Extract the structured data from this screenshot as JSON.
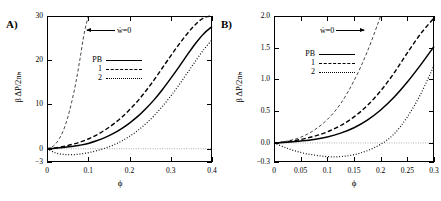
{
  "figure": {
    "panels": [
      {
        "id": "A",
        "label": "A)",
        "ylabel": "β ΔP/2nₕ",
        "xlabel": "ϕ",
        "yticks": [
          "30",
          "20",
          "10",
          "0",
          "-3"
        ],
        "ytick_values": [
          30,
          20,
          10,
          0,
          -3
        ],
        "xticks": [
          "0",
          "0.1",
          "0.2",
          "0.3",
          "0.4"
        ],
        "xtick_values": [
          0,
          0.1,
          0.2,
          0.3,
          0.4
        ],
        "xlim": [
          0,
          0.4
        ],
        "ylim": [
          -3,
          30
        ],
        "annotation": "ẇ=0",
        "annotation_direction": "left",
        "legend": [
          {
            "key": "PB",
            "style": "solid"
          },
          {
            "key": "1",
            "style": "dash"
          },
          {
            "key": "2",
            "style": "dot"
          }
        ]
      },
      {
        "id": "B",
        "label": "B)",
        "ylabel": "β ΔP/2nₕ",
        "xlabel": "ϕ",
        "yticks": [
          "2.0",
          "1.5",
          "1.0",
          "0.5",
          "0.0",
          "-0.3"
        ],
        "ytick_values": [
          2.0,
          1.5,
          1.0,
          0.5,
          0.0,
          -0.3
        ],
        "xticks": [
          "0",
          "0.05",
          "0.1",
          "0.15",
          "0.2",
          "0.25",
          "0.3"
        ],
        "xtick_values": [
          0,
          0.05,
          0.1,
          0.15,
          0.2,
          0.25,
          0.3
        ],
        "xlim": [
          0,
          0.3
        ],
        "ylim": [
          -0.3,
          2.0
        ],
        "annotation": "ẇ=0",
        "annotation_direction": "right",
        "legend": [
          {
            "key": "PB",
            "style": "solid"
          },
          {
            "key": "1",
            "style": "dash"
          },
          {
            "key": "2",
            "style": "dot"
          }
        ]
      }
    ]
  },
  "chart_data": [
    {
      "type": "line",
      "title": "A)",
      "xlabel": "ϕ",
      "ylabel": "β ΔP/2nₕ",
      "xlim": [
        0,
        0.4
      ],
      "ylim": [
        -3,
        30
      ],
      "grid": false,
      "legend_position": "upper-left-inside",
      "annotations": [
        {
          "text": "ẇ=0",
          "points_to": "steep-dashed-curve",
          "direction": "left"
        }
      ],
      "series": [
        {
          "name": "PB",
          "style": "solid",
          "x": [
            0,
            0.02,
            0.04,
            0.06,
            0.08,
            0.1,
            0.12,
            0.14,
            0.16,
            0.18,
            0.2,
            0.22,
            0.24,
            0.26,
            0.28,
            0.3,
            0.32,
            0.34,
            0.36,
            0.38,
            0.4
          ],
          "y": [
            0,
            0.1,
            0.25,
            0.5,
            0.8,
            1.2,
            1.8,
            2.5,
            3.4,
            4.5,
            5.8,
            7.3,
            9.1,
            11.1,
            13.4,
            15.9,
            18.5,
            21.2,
            23.8,
            26.0,
            27.6
          ]
        },
        {
          "name": "1",
          "style": "dash",
          "x": [
            0,
            0.02,
            0.04,
            0.06,
            0.08,
            0.1,
            0.12,
            0.14,
            0.16,
            0.18,
            0.2,
            0.22,
            0.24,
            0.26,
            0.28,
            0.3,
            0.32,
            0.34,
            0.36,
            0.38,
            0.4
          ],
          "y": [
            0,
            0.2,
            0.5,
            0.95,
            1.5,
            2.2,
            3.1,
            4.2,
            5.5,
            7.0,
            8.8,
            10.8,
            13.1,
            15.6,
            18.3,
            21.0,
            23.6,
            26.0,
            28.1,
            29.6,
            30.0
          ]
        },
        {
          "name": "2",
          "style": "dot",
          "x": [
            0,
            0.02,
            0.04,
            0.06,
            0.08,
            0.1,
            0.12,
            0.14,
            0.16,
            0.18,
            0.2,
            0.22,
            0.24,
            0.26,
            0.28,
            0.3,
            0.32,
            0.34,
            0.36,
            0.38,
            0.4
          ],
          "y": [
            0,
            -0.9,
            -1.3,
            -1.35,
            -1.2,
            -0.9,
            -0.45,
            0.1,
            0.8,
            1.7,
            2.8,
            4.1,
            5.7,
            7.5,
            9.6,
            11.9,
            14.4,
            17.1,
            19.8,
            22.4,
            24.6
          ]
        },
        {
          "name": "psi-dot-zero",
          "style": "dash-thin",
          "x": [
            0,
            0.01,
            0.02,
            0.03,
            0.04,
            0.05,
            0.06,
            0.07,
            0.08,
            0.09,
            0.1
          ],
          "y": [
            0,
            0.3,
            1.0,
            2.3,
            4.2,
            7.0,
            10.6,
            15.0,
            20.3,
            26.0,
            30.0
          ]
        }
      ]
    },
    {
      "type": "line",
      "title": "B)",
      "xlabel": "ϕ",
      "ylabel": "β ΔP/2nₕ",
      "xlim": [
        0,
        0.3
      ],
      "ylim": [
        -0.3,
        2.0
      ],
      "grid": false,
      "legend_position": "upper-left-inside",
      "annotations": [
        {
          "text": "ẇ=0",
          "points_to": "steep-dashed-curve",
          "direction": "right"
        }
      ],
      "series": [
        {
          "name": "PB",
          "style": "solid",
          "x": [
            0,
            0.025,
            0.05,
            0.075,
            0.1,
            0.125,
            0.15,
            0.175,
            0.2,
            0.225,
            0.25,
            0.275,
            0.3
          ],
          "y": [
            0,
            0.01,
            0.03,
            0.055,
            0.095,
            0.155,
            0.24,
            0.36,
            0.52,
            0.72,
            0.96,
            1.23,
            1.52
          ]
        },
        {
          "name": "1",
          "style": "dash",
          "x": [
            0,
            0.025,
            0.05,
            0.075,
            0.1,
            0.125,
            0.15,
            0.175,
            0.2,
            0.225,
            0.25,
            0.275,
            0.3
          ],
          "y": [
            0,
            0.02,
            0.055,
            0.105,
            0.175,
            0.275,
            0.41,
            0.59,
            0.82,
            1.1,
            1.42,
            1.72,
            1.97
          ]
        },
        {
          "name": "2",
          "style": "dot",
          "x": [
            0,
            0.025,
            0.05,
            0.075,
            0.1,
            0.125,
            0.15,
            0.175,
            0.2,
            0.225,
            0.25,
            0.275,
            0.3
          ],
          "y": [
            0,
            -0.085,
            -0.15,
            -0.19,
            -0.215,
            -0.215,
            -0.185,
            -0.12,
            -0.02,
            0.14,
            0.41,
            0.77,
            1.22
          ]
        },
        {
          "name": "psi-dot-zero",
          "style": "dash-thin",
          "x": [
            0,
            0.025,
            0.05,
            0.075,
            0.1,
            0.125,
            0.15,
            0.175,
            0.2
          ],
          "y": [
            0,
            0.03,
            0.09,
            0.2,
            0.37,
            0.62,
            0.98,
            1.44,
            2.0
          ]
        }
      ]
    }
  ]
}
